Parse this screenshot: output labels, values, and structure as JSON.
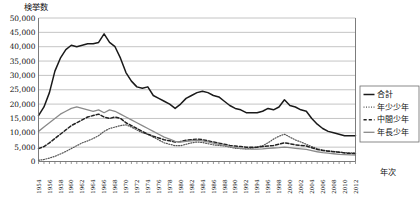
{
  "chart_data": {
    "type": "line",
    "title": "",
    "ylabel": "検挙数",
    "xlabel": "年次",
    "ylim": [
      0,
      50000
    ],
    "ytick_labels": [
      "50,000",
      "45,000",
      "40,000",
      "35,000",
      "30,000",
      "25,000",
      "20,000",
      "15,000",
      "10,000",
      "5,000",
      "0"
    ],
    "ytick_values": [
      50000,
      45000,
      40000,
      35000,
      30000,
      25000,
      20000,
      15000,
      10000,
      5000,
      0
    ],
    "grid": true,
    "legend_position": "right",
    "x": [
      1954,
      1955,
      1956,
      1957,
      1958,
      1959,
      1960,
      1961,
      1962,
      1963,
      1964,
      1965,
      1966,
      1967,
      1968,
      1969,
      1970,
      1971,
      1972,
      1973,
      1974,
      1975,
      1976,
      1977,
      1978,
      1979,
      1980,
      1981,
      1982,
      1983,
      1984,
      1985,
      1986,
      1987,
      1988,
      1989,
      1990,
      1991,
      1992,
      1993,
      1994,
      1995,
      1996,
      1997,
      1998,
      1999,
      2000,
      2001,
      2002,
      2003,
      2004,
      2005,
      2006,
      2007,
      2008,
      2009,
      2010,
      2011,
      2012
    ],
    "xtick_labels": [
      "1954",
      "1956",
      "1958",
      "1960",
      "1962",
      "1964",
      "1966",
      "1968",
      "1970",
      "1972",
      "1974",
      "1976",
      "1978",
      "1980",
      "1982",
      "1984",
      "1986",
      "1988",
      "1990",
      "1992",
      "1994",
      "1996",
      "1998",
      "2000",
      "2002",
      "2004",
      "2006",
      "2008",
      "2010",
      "2012"
    ],
    "series": [
      {
        "name": "合計",
        "style": "solid",
        "color": "#1a1a1a",
        "width": 1.5,
        "values": [
          16000,
          19000,
          24000,
          31500,
          36000,
          39000,
          40500,
          40000,
          40500,
          41000,
          41000,
          41500,
          44500,
          41500,
          40000,
          36000,
          31000,
          28000,
          26000,
          25500,
          26000,
          23000,
          22000,
          21000,
          20000,
          18500,
          20000,
          22000,
          23000,
          24000,
          24500,
          24000,
          23000,
          22500,
          21000,
          19500,
          18500,
          18000,
          17000,
          17000,
          17000,
          17500,
          18500,
          18000,
          19000,
          21500,
          19500,
          19000,
          18000,
          17500,
          15000,
          13000,
          11500,
          10500,
          10000,
          9500,
          9000,
          9000,
          9000
        ]
      },
      {
        "name": "年少少年",
        "style": "dotted-fine",
        "color": "#555555",
        "width": 1.2,
        "values": [
          400,
          700,
          1200,
          1800,
          2600,
          3500,
          4500,
          5500,
          6500,
          7200,
          8000,
          9000,
          10500,
          11500,
          12000,
          12500,
          12800,
          12000,
          11000,
          10000,
          9500,
          8500,
          7500,
          6500,
          6000,
          5500,
          5500,
          6000,
          6500,
          6800,
          6600,
          6200,
          5800,
          5600,
          5400,
          5000,
          4600,
          4500,
          4400,
          4600,
          5000,
          5500,
          6500,
          7800,
          8800,
          9500,
          8500,
          7500,
          6800,
          6000,
          5200,
          4500,
          4000,
          3700,
          3500,
          3300,
          3100,
          3000,
          3000
        ]
      },
      {
        "name": "中間少年",
        "style": "dashed",
        "color": "#222222",
        "width": 1.5,
        "values": [
          4500,
          5200,
          6500,
          8000,
          9500,
          11000,
          12500,
          13500,
          14500,
          15500,
          16000,
          16500,
          15500,
          15000,
          15500,
          15000,
          13500,
          12500,
          11500,
          10500,
          9500,
          8800,
          8200,
          7600,
          7200,
          6800,
          7000,
          7400,
          7600,
          7800,
          7600,
          7200,
          6800,
          6400,
          6000,
          5600,
          5400,
          5200,
          5000,
          5000,
          5000,
          5200,
          5400,
          5600,
          6000,
          6500,
          6200,
          5800,
          5600,
          5400,
          4800,
          4200,
          3800,
          3600,
          3400,
          3200,
          3000,
          2800,
          2700
        ]
      },
      {
        "name": "年長少年",
        "style": "solid-gray",
        "color": "#8a8a8a",
        "width": 1.3,
        "values": [
          10500,
          12000,
          13500,
          15000,
          16500,
          17500,
          18500,
          19000,
          18500,
          18000,
          17500,
          18000,
          17000,
          18000,
          17500,
          16500,
          15500,
          14500,
          13500,
          12500,
          11500,
          10500,
          9500,
          8500,
          7800,
          7000,
          6800,
          7000,
          7200,
          7400,
          7200,
          6800,
          6400,
          6000,
          5600,
          5200,
          4800,
          4600,
          4400,
          4300,
          4300,
          4400,
          4600,
          4700,
          4800,
          5000,
          4800,
          4600,
          4400,
          4200,
          3800,
          3400,
          3100,
          2900,
          2700,
          2500,
          2400,
          2300,
          2200
        ]
      }
    ]
  },
  "legend": {
    "entries": [
      {
        "label": "合計"
      },
      {
        "label": "年少少年"
      },
      {
        "label": "中間少年"
      },
      {
        "label": "年長少年"
      }
    ]
  }
}
